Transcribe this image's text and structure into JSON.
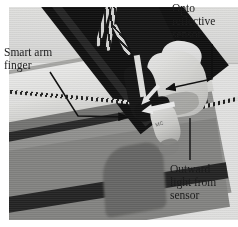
{
  "figure": {
    "kind": "annotated-photograph",
    "rendering": "grayscale halftone print",
    "width_px": 238,
    "height_px": 227
  },
  "colors": {
    "page_background": "#ffffff",
    "photo_backdrop_light": "#f2f2f0",
    "photo_table_gray": "#9c9c9a",
    "arm_black": "#101010",
    "finger_white": "#fdfdfc",
    "annotation_text": "#1c1c1c",
    "annotation_line": "#111111",
    "highlight_arrow": "#ffffff"
  },
  "annotations": [
    {
      "id": "smart-arm-finger",
      "label": "Smart arm\nfinger",
      "label_lines": [
        "Smart arm",
        "finger"
      ],
      "position": "left",
      "leader": "diagonal down-right then horizontal right with arrowhead",
      "arrow_color": "#111111",
      "points_to": "pale gripper finger plate"
    },
    {
      "id": "opto-reflective-sensor",
      "label": "Opto\nreflective\nsensor",
      "label_lines": [
        "Opto",
        "reflective",
        "sensor"
      ],
      "position": "top-right",
      "leader": "down then left with arrowhead",
      "arrow_color": "#111111",
      "points_to": "translucent sensor housing"
    },
    {
      "id": "outward-light-from-sensor",
      "label": "Outward\nlight from\nsensor",
      "label_lines": [
        "Outward",
        "light from",
        "sensor"
      ],
      "position": "bottom-right",
      "leader": "vertical line upward, no arrowhead",
      "arrow_color": "#111111",
      "points_to": "white highlight beam leaving the sensor"
    }
  ],
  "photo_elements": {
    "sensor_print": "MC",
    "parts": [
      "black diagonal arm link",
      "twisted signal wire pair",
      "translucent sensor housing",
      "opto reflective sensor capsule",
      "pale gripper finger plate",
      "gray work table"
    ],
    "highlight_arrows": [
      {
        "name": "outward-light-beam-arrow",
        "direction": "left"
      },
      {
        "name": "reflected-light-arrow",
        "direction": "up-left"
      }
    ]
  }
}
